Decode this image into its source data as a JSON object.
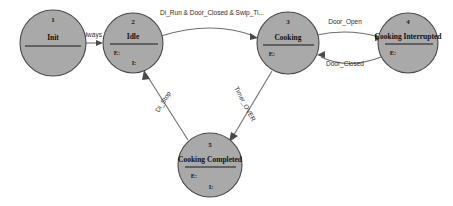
{
  "diagram": {
    "type": "state-machine",
    "background_color": "#ffffff",
    "state_fill_color": "#a9a9a9",
    "state_stroke_color": "#4a4a4a",
    "edge_color": "#6e6e6e",
    "states": [
      {
        "id": 1,
        "number": "1",
        "name": "Init",
        "entry_label": "",
        "internal_label": "",
        "cx": 53,
        "cy": 43,
        "r": 33
      },
      {
        "id": 2,
        "number": "2",
        "name": "Idle",
        "entry_label": "E:",
        "internal_label": "I:",
        "cx": 133,
        "cy": 43,
        "r": 30
      },
      {
        "id": 3,
        "number": "3",
        "name": "Cooking",
        "entry_label": "E:",
        "internal_label": "",
        "cx": 288,
        "cy": 43,
        "r": 31
      },
      {
        "id": 4,
        "number": "4",
        "name": "Cooking Interrupted",
        "entry_label": "E:",
        "internal_label": "",
        "cx": 408,
        "cy": 43,
        "r": 30
      },
      {
        "id": 5,
        "number": "5",
        "name": "Cooking Completed",
        "entry_label": "E:",
        "internal_label": "I:",
        "cx": 210,
        "cy": 165,
        "r": 32
      }
    ],
    "transitions": [
      {
        "id": "t1",
        "label": "always",
        "from": 1,
        "to": 2,
        "label_x": 92,
        "label_y": 37,
        "rotation": 0
      },
      {
        "id": "t2",
        "label": "Di_Run & Door_Closed & Swip_Ti...",
        "from": 2,
        "to": 3,
        "label_x": 212,
        "label_y": 15,
        "rotation": 0
      },
      {
        "id": "t3",
        "label": "Door_Open",
        "from": 3,
        "to": 4,
        "label_x": 345,
        "label_y": 24,
        "rotation": 0
      },
      {
        "id": "t4",
        "label": "Door_Closed",
        "from": 4,
        "to": 3,
        "label_x": 345,
        "label_y": 66,
        "rotation": 0
      },
      {
        "id": "t5",
        "label": "Di_Stop",
        "from": 5,
        "to": 2,
        "label_x": 165,
        "label_y": 103,
        "rotation": -58
      },
      {
        "id": "t6",
        "label": "Timer_OVER",
        "from": 3,
        "to": 5,
        "label_x": 243,
        "label_y": 105,
        "rotation": 62
      }
    ]
  }
}
